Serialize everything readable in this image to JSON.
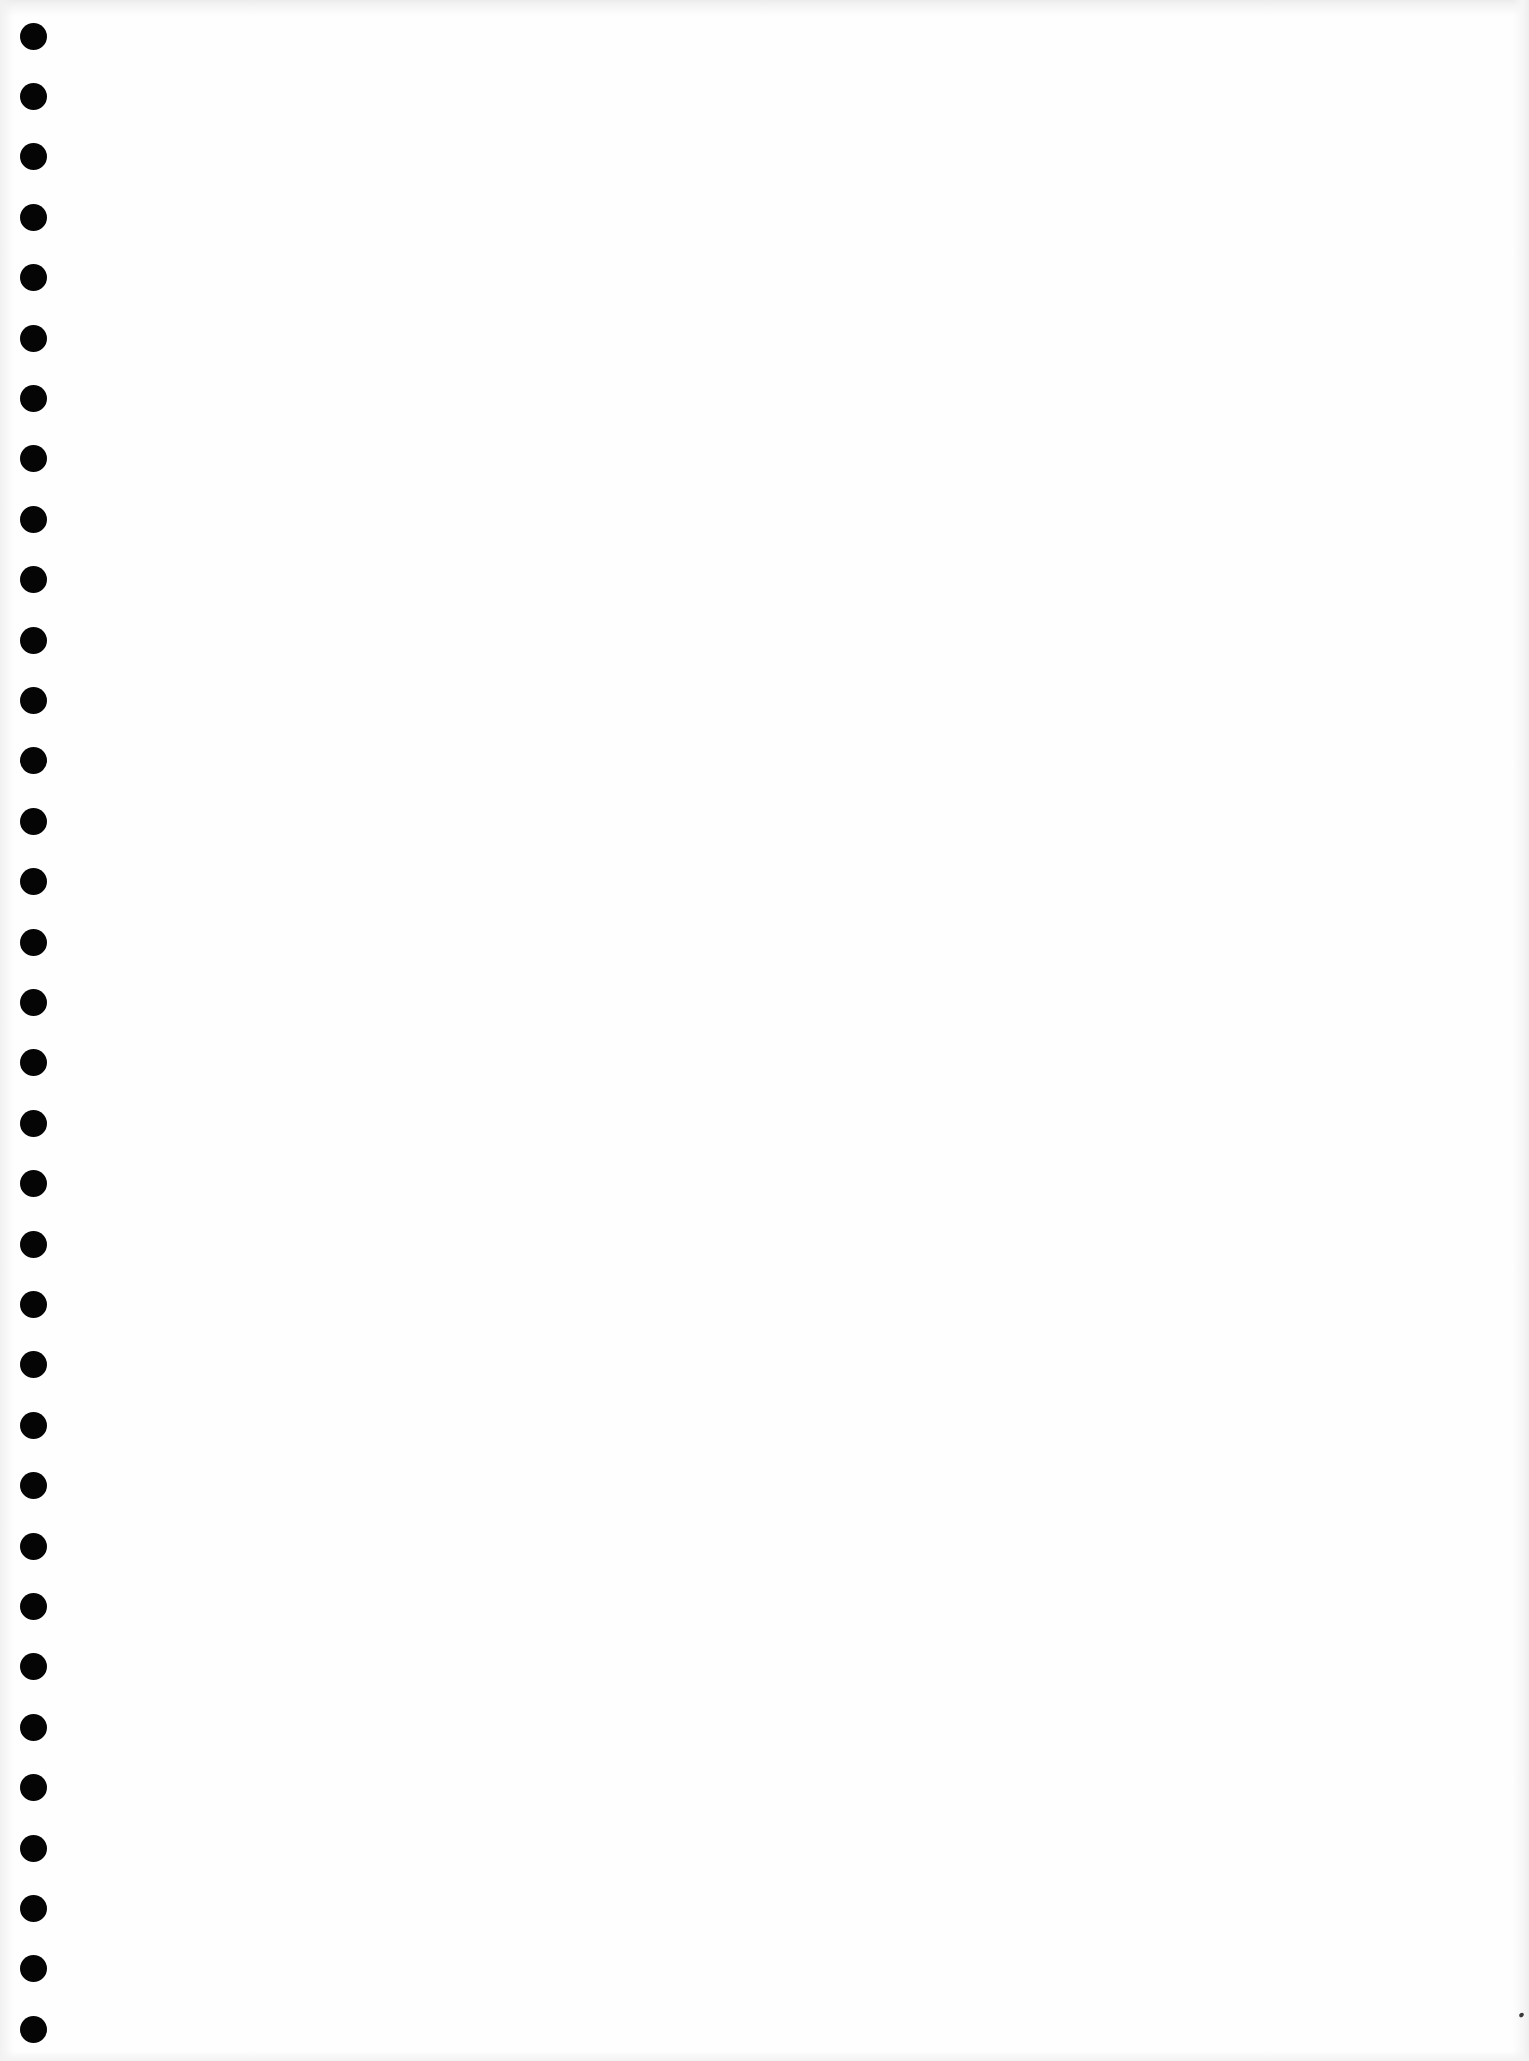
{
  "document": {
    "type": "blank loose-leaf sheet (scanned)",
    "text_content": [],
    "binding_holes": {
      "count": 34,
      "column_center_x": 33,
      "first_center_y": 36,
      "pitch_y": 60.4,
      "diameter": 27,
      "color": "#050505"
    },
    "paper_color": "#fefefe",
    "artifacts": [
      {
        "kind": "speck",
        "x": 1519,
        "y": 2013,
        "color": "#3a3a3a"
      }
    ]
  }
}
